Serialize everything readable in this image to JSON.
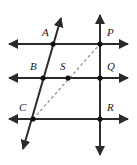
{
  "figure": {
    "width": 137,
    "height": 165,
    "background_color": "#ffffff",
    "stroke_color": "#2b2b2b",
    "dashed_color": "#8a8a8a",
    "point_color": "#1a1a1a"
  },
  "labels": {
    "A": "A",
    "B": "B",
    "C": "C",
    "P": "P",
    "Q": "Q",
    "R": "R",
    "S": "S"
  },
  "points": [
    {
      "name": "A",
      "label": "A",
      "x": 53,
      "y": 44,
      "label_x": 42,
      "label_y": 35
    },
    {
      "name": "P",
      "label": "P",
      "x": 100,
      "y": 44,
      "label_x": 108,
      "label_y": 35
    },
    {
      "name": "B",
      "label": "B",
      "x": 43,
      "y": 78,
      "label_x": 31,
      "label_y": 69
    },
    {
      "name": "S",
      "label": "S",
      "x": 68,
      "y": 78,
      "label_x": 60,
      "label_y": 69
    },
    {
      "name": "Q",
      "label": "Q",
      "x": 100,
      "y": 78,
      "label_x": 108,
      "label_y": 69
    },
    {
      "name": "C",
      "label": "C",
      "x": 33,
      "y": 119,
      "label_x": 20,
      "label_y": 110
    },
    {
      "name": "R",
      "label": "R",
      "x": 100,
      "y": 119,
      "label_x": 108,
      "label_y": 110
    }
  ],
  "lines": {
    "horizontal": [
      {
        "name": "line-AP",
        "x1": 6,
        "y1": 44,
        "x2": 131,
        "y2": 44
      },
      {
        "name": "line-BSQ",
        "x1": 6,
        "y1": 78,
        "x2": 131,
        "y2": 78
      },
      {
        "name": "line-CR",
        "x1": 6,
        "y1": 119,
        "x2": 131,
        "y2": 119
      }
    ],
    "vertical": {
      "name": "line-PQR",
      "x1": 100,
      "y1": 12,
      "x2": 100,
      "y2": 158
    },
    "transversal": {
      "name": "line-ABC",
      "x1": 62,
      "y1": 15,
      "x2": 22,
      "y2": 152
    },
    "dashed": {
      "name": "segment-CP",
      "x1": 33,
      "y1": 119,
      "x2": 100,
      "y2": 44
    }
  }
}
